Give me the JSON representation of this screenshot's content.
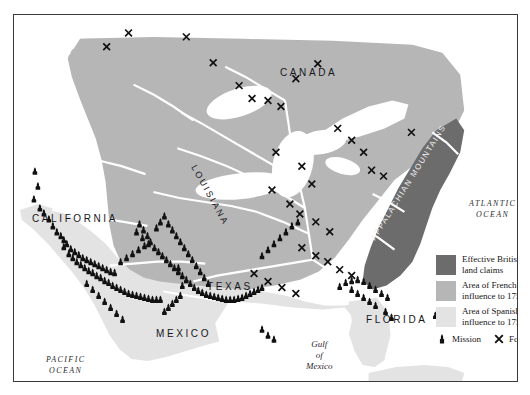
{
  "map": {
    "title": "Colonial North America c. 1750",
    "frame": {
      "x": 13,
      "y": 14,
      "width": 505,
      "height": 368
    },
    "background_color": "#ffffff",
    "regions": {
      "british_color": "#6c6c6c",
      "french_color": "#b6b6b6",
      "spanish_color": "#e3e3e3",
      "water_color": "#ffffff",
      "river_color": "#f2f2f2",
      "border_color": "#3a3a3a"
    },
    "labels": [
      {
        "id": "canada",
        "text": "CANADA",
        "x": 266,
        "y": 52,
        "kind": "country"
      },
      {
        "id": "california",
        "text": "CALIFORNIA",
        "x": 18,
        "y": 198,
        "kind": "country"
      },
      {
        "id": "texas",
        "text": "TEXAS",
        "x": 193,
        "y": 266,
        "kind": "country"
      },
      {
        "id": "mexico",
        "text": "MEXICO",
        "x": 142,
        "y": 313,
        "kind": "country"
      },
      {
        "id": "florida",
        "text": "FLORIDA",
        "x": 352,
        "y": 299,
        "kind": "country"
      },
      {
        "id": "louisiana",
        "text": "LOUISIANA",
        "x": 184,
        "y": 148,
        "kind": "rotated"
      },
      {
        "id": "appalachian",
        "text": "APPALACHIAN MOUNTAINS",
        "x": 355,
        "y": 222,
        "kind": "rotated"
      },
      {
        "id": "cuba",
        "text": "CUBA",
        "x": 396,
        "y": 370,
        "kind": "island"
      }
    ],
    "oceans": [
      {
        "id": "atlantic",
        "line1": "ATLANTIC",
        "line2": "OCEAN",
        "x": 455,
        "y": 183
      },
      {
        "id": "pacific",
        "line1": "PACIFIC",
        "line2": "OCEAN",
        "x": 32,
        "y": 339
      }
    ],
    "gulf": {
      "line1": "Gulf",
      "line2": "of",
      "line3": "Mexico",
      "x": 292,
      "y": 324
    }
  },
  "legend": {
    "items": [
      {
        "label_line1": "Effective British",
        "label_line2": "land claims",
        "color": "#6c6c6c"
      },
      {
        "label_line1": "Area of French",
        "label_line2": "influence to 1750",
        "color": "#b6b6b6"
      },
      {
        "label_line1": "Area of Spanish",
        "label_line2": "influence to 1750",
        "color": "#e3e3e3"
      }
    ],
    "markers": [
      {
        "label": "Mission",
        "icon": "mission-marker-icon"
      },
      {
        "label": "Fort",
        "icon": "fort-marker-icon"
      }
    ]
  },
  "markers": {
    "mission_count": 118,
    "fort_count": 33,
    "missions": [
      [
        34,
        171
      ],
      [
        37,
        186
      ],
      [
        33,
        199
      ],
      [
        39,
        208
      ],
      [
        43,
        213
      ],
      [
        48,
        219
      ],
      [
        52,
        226
      ],
      [
        56,
        232
      ],
      [
        60,
        236
      ],
      [
        63,
        240
      ],
      [
        66,
        244
      ],
      [
        70,
        249
      ],
      [
        74,
        252
      ],
      [
        78,
        255
      ],
      [
        82,
        258
      ],
      [
        86,
        260
      ],
      [
        90,
        262
      ],
      [
        94,
        264
      ],
      [
        98,
        266
      ],
      [
        102,
        268
      ],
      [
        106,
        270
      ],
      [
        110,
        272
      ],
      [
        114,
        273
      ],
      [
        63,
        247
      ],
      [
        68,
        254
      ],
      [
        72,
        258
      ],
      [
        76,
        262
      ],
      [
        80,
        265
      ],
      [
        84,
        268
      ],
      [
        88,
        271
      ],
      [
        92,
        273
      ],
      [
        96,
        276
      ],
      [
        100,
        278
      ],
      [
        104,
        281
      ],
      [
        108,
        283
      ],
      [
        112,
        286
      ],
      [
        116,
        288
      ],
      [
        120,
        290
      ],
      [
        124,
        292
      ],
      [
        128,
        294
      ],
      [
        132,
        295
      ],
      [
        136,
        296
      ],
      [
        140,
        297
      ],
      [
        144,
        298
      ],
      [
        148,
        299
      ],
      [
        152,
        300
      ],
      [
        156,
        300
      ],
      [
        160,
        300
      ],
      [
        120,
        262
      ],
      [
        126,
        258
      ],
      [
        132,
        254
      ],
      [
        138,
        250
      ],
      [
        144,
        246
      ],
      [
        150,
        242
      ],
      [
        147,
        236
      ],
      [
        143,
        230
      ],
      [
        139,
        224
      ],
      [
        136,
        232
      ],
      [
        142,
        238
      ],
      [
        148,
        244
      ],
      [
        154,
        248
      ],
      [
        158,
        252
      ],
      [
        162,
        256
      ],
      [
        166,
        260
      ],
      [
        170,
        264
      ],
      [
        174,
        268
      ],
      [
        178,
        272
      ],
      [
        182,
        276
      ],
      [
        186,
        280
      ],
      [
        190,
        284
      ],
      [
        194,
        288
      ],
      [
        198,
        291
      ],
      [
        202,
        293
      ],
      [
        206,
        295
      ],
      [
        210,
        296
      ],
      [
        214,
        297
      ],
      [
        218,
        298
      ],
      [
        222,
        299
      ],
      [
        226,
        300
      ],
      [
        230,
        300
      ],
      [
        234,
        300
      ],
      [
        238,
        299
      ],
      [
        242,
        298
      ],
      [
        246,
        296
      ],
      [
        250,
        294
      ],
      [
        254,
        292
      ],
      [
        258,
        290
      ],
      [
        262,
        288
      ],
      [
        180,
        296
      ],
      [
        176,
        300
      ],
      [
        172,
        304
      ],
      [
        168,
        308
      ],
      [
        164,
        312
      ],
      [
        178,
        268
      ],
      [
        156,
        228
      ],
      [
        160,
        222
      ],
      [
        164,
        216
      ],
      [
        168,
        224
      ],
      [
        172,
        230
      ],
      [
        176,
        236
      ],
      [
        180,
        242
      ],
      [
        184,
        248
      ],
      [
        188,
        254
      ],
      [
        192,
        260
      ],
      [
        196,
        266
      ],
      [
        200,
        272
      ],
      [
        204,
        278
      ],
      [
        208,
        284
      ],
      [
        262,
        256
      ],
      [
        268,
        250
      ],
      [
        274,
        244
      ],
      [
        280,
        238
      ],
      [
        286,
        232
      ],
      [
        292,
        226
      ],
      [
        298,
        222
      ],
      [
        340,
        287
      ],
      [
        346,
        283
      ],
      [
        352,
        281
      ],
      [
        358,
        280
      ],
      [
        364,
        282
      ],
      [
        370,
        286
      ],
      [
        376,
        290
      ],
      [
        382,
        294
      ],
      [
        388,
        298
      ],
      [
        352,
        290
      ],
      [
        358,
        294
      ],
      [
        364,
        298
      ],
      [
        370,
        302
      ],
      [
        376,
        306
      ],
      [
        386,
        312
      ],
      [
        392,
        318
      ],
      [
        436,
        316
      ],
      [
        262,
        330
      ],
      [
        268,
        336
      ],
      [
        274,
        340
      ],
      [
        182,
        286
      ],
      [
        86,
        284
      ],
      [
        92,
        290
      ],
      [
        98,
        296
      ],
      [
        104,
        302
      ],
      [
        110,
        308
      ],
      [
        116,
        314
      ],
      [
        122,
        320
      ]
    ],
    "forts": [
      [
        106,
        46
      ],
      [
        128,
        32
      ],
      [
        186,
        36
      ],
      [
        213,
        62
      ],
      [
        239,
        85
      ],
      [
        252,
        98
      ],
      [
        268,
        100
      ],
      [
        281,
        106
      ],
      [
        318,
        63
      ],
      [
        296,
        78
      ],
      [
        338,
        128
      ],
      [
        352,
        140
      ],
      [
        364,
        152
      ],
      [
        372,
        170
      ],
      [
        384,
        176
      ],
      [
        276,
        152
      ],
      [
        302,
        166
      ],
      [
        312,
        184
      ],
      [
        272,
        190
      ],
      [
        290,
        204
      ],
      [
        300,
        214
      ],
      [
        316,
        222
      ],
      [
        330,
        232
      ],
      [
        302,
        248
      ],
      [
        316,
        256
      ],
      [
        328,
        262
      ],
      [
        340,
        270
      ],
      [
        352,
        276
      ],
      [
        254,
        274
      ],
      [
        268,
        282
      ],
      [
        282,
        288
      ],
      [
        296,
        294
      ],
      [
        412,
        132
      ]
    ]
  }
}
